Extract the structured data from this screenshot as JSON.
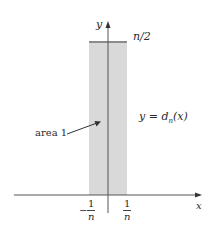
{
  "figure": {
    "type": "diagram",
    "colors": {
      "axis": "#555555",
      "rect_fill": "#d9d9d9",
      "top_line": "#8c8c8c",
      "text": "#2a2a2a",
      "background": "#ffffff"
    }
  },
  "axes": {
    "x_label": "x",
    "y_label": "y"
  },
  "labels": {
    "height_label": "n/2",
    "function_label_prefix": "y = ",
    "function_label_name": "d",
    "function_label_sub": "n",
    "function_label_arg": "(x)",
    "area_label": "area 1"
  },
  "ticks": {
    "left": {
      "sign": "−",
      "numerator": "1",
      "denominator": "n"
    },
    "right": {
      "numerator": "1",
      "denominator": "n"
    }
  }
}
